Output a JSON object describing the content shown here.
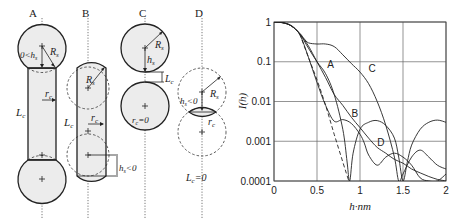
{
  "panels": {
    "A": {
      "label": "A",
      "annotations": {
        "hs": "0<h",
        "hs_sub": "s",
        "Rs": "R",
        "Rs_sub": "s",
        "rc": "r",
        "rc_sub": "c",
        "Lc": "L",
        "Lc_sub": "c"
      }
    },
    "B": {
      "label": "B",
      "annotations": {
        "Rs": "R",
        "Rs_sub": "s",
        "rc": "r",
        "rc_sub": "c",
        "Lc": "L",
        "Lc_sub": "c",
        "hs": "h",
        "hs_sub": "s",
        "hs_rel": "<0"
      }
    },
    "C": {
      "label": "C",
      "annotations": {
        "Rs": "R",
        "Rs_sub": "s",
        "hs": "h",
        "hs_sub": "s",
        "Lc": "L",
        "Lc_sub": "c",
        "rc": "r",
        "rc_sub": "c",
        "rc_rel": "=0"
      }
    },
    "D": {
      "label": "D",
      "annotations": {
        "Rs": "R",
        "Rs_sub": "s",
        "hs": "h",
        "hs_sub": "s",
        "hs_rel": "<0",
        "rc": "r",
        "rc_sub": "c",
        "Lc": "L",
        "Lc_sub": "c",
        "Lc_rel": "=0"
      }
    }
  },
  "chart_data": {
    "type": "line",
    "title": "",
    "xlabel": "h·nm",
    "ylabel": "I(h)",
    "xlim": [
      0,
      2
    ],
    "ylim": [
      0.0001,
      1
    ],
    "yscale": "log",
    "grid": true,
    "xticks": [
      "0",
      "0.5",
      "1",
      "1.5",
      "2"
    ],
    "yticks": [
      "1",
      "0.1",
      "0.01",
      "0.001",
      "0.0001"
    ],
    "legend": "inline curve labels",
    "series": [
      {
        "name": "A",
        "style": "solid",
        "x": [
          0,
          0.1,
          0.2,
          0.3,
          0.4,
          0.5,
          0.6,
          0.7,
          0.8,
          0.85,
          0.88,
          0.92,
          1.0,
          1.1,
          1.2,
          1.3,
          1.4,
          1.45,
          1.5,
          1.55,
          1.6,
          1.7,
          1.8,
          1.9,
          2.0
        ],
        "y": [
          1,
          0.96,
          0.8,
          0.5,
          0.22,
          0.1,
          0.05,
          0.015,
          0.002,
          0.0003,
          0.0001,
          0.0005,
          0.002,
          0.003,
          0.0033,
          0.0025,
          0.0012,
          0.0004,
          0.0001,
          0.0003,
          0.0008,
          0.002,
          0.003,
          0.0034,
          0.003
        ]
      },
      {
        "name": "B",
        "style": "solid",
        "x": [
          0,
          0.1,
          0.2,
          0.3,
          0.4,
          0.5,
          0.6,
          0.7,
          0.8,
          0.9,
          1.0,
          1.05,
          1.1,
          1.2,
          1.3,
          1.4,
          1.5,
          1.6,
          1.7,
          1.8,
          1.9,
          2.0
        ],
        "y": [
          1,
          0.96,
          0.8,
          0.48,
          0.13,
          0.03,
          0.008,
          0.0032,
          0.0035,
          0.0028,
          0.0015,
          0.0009,
          0.00045,
          0.00025,
          0.0004,
          0.0005,
          0.0004,
          0.00025,
          0.00012,
          8e-05,
          0.0001,
          0.00015
        ]
      },
      {
        "name": "C",
        "style": "solid",
        "x": [
          0,
          0.1,
          0.2,
          0.3,
          0.35,
          0.4,
          0.5,
          0.6,
          0.7,
          0.8,
          0.9,
          1.0,
          1.1,
          1.2,
          1.3,
          1.4,
          1.45,
          1.5,
          1.6,
          1.7,
          1.8,
          1.9,
          2.0
        ],
        "y": [
          1,
          0.96,
          0.82,
          0.52,
          0.38,
          0.3,
          0.28,
          0.28,
          0.24,
          0.15,
          0.09,
          0.055,
          0.028,
          0.01,
          0.0025,
          0.0004,
          0.0001,
          0.00015,
          0.0004,
          0.0006,
          0.0004,
          0.00025,
          0.0002
        ]
      },
      {
        "name": "D",
        "style": "solid",
        "x": [
          0,
          0.1,
          0.2,
          0.3,
          0.4,
          0.5,
          0.6,
          0.7,
          0.8,
          0.9,
          1.0,
          1.1,
          1.2,
          1.3,
          1.4,
          1.5,
          1.6,
          1.7,
          1.8,
          1.9,
          2.0
        ],
        "y": [
          1,
          0.96,
          0.8,
          0.5,
          0.25,
          0.1,
          0.04,
          0.015,
          0.008,
          0.004,
          0.0022,
          0.0012,
          0.0007,
          0.0005,
          0.00035,
          0.00028,
          0.0002,
          0.00016,
          0.00013,
          0.00011,
          0.0001
        ]
      },
      {
        "name": "Gaussian approx.",
        "style": "dashed",
        "x": [
          0.3,
          0.4,
          0.5,
          0.6,
          0.7,
          0.8,
          0.87
        ],
        "y": [
          0.5,
          0.13,
          0.035,
          0.008,
          0.0015,
          0.0003,
          0.0001
        ]
      }
    ],
    "annotations": [
      {
        "text": "A",
        "x": 0.62,
        "y": 0.07
      },
      {
        "text": "B",
        "x": 0.9,
        "y": 0.004
      },
      {
        "text": "C",
        "x": 1.1,
        "y": 0.055
      },
      {
        "text": "D",
        "x": 1.2,
        "y": 0.00075
      }
    ]
  }
}
